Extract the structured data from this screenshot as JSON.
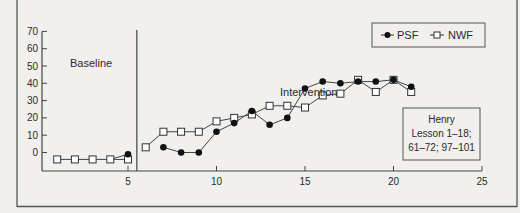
{
  "chart_data": {
    "type": "line",
    "title": "",
    "xlabel": "",
    "ylabel": "",
    "xlim": [
      0,
      25
    ],
    "ylim": [
      -10,
      70
    ],
    "x_ticks": [
      5,
      10,
      15,
      20,
      25
    ],
    "y_ticks": [
      0,
      10,
      20,
      30,
      40,
      50,
      60,
      70
    ],
    "grid": false,
    "legend_position": "upper right (boxed)",
    "phases": [
      {
        "label": "Baseline",
        "sessions": [
          1,
          5
        ]
      },
      {
        "label": "Intervention",
        "sessions": [
          6,
          21
        ]
      }
    ],
    "phase_change_after_session": 5.5,
    "series": [
      {
        "name": "PSF",
        "marker": "filled-circle",
        "segments": [
          {
            "x": [
              5
            ],
            "y": [
              -1
            ]
          },
          {
            "x": [
              7,
              8,
              9,
              10,
              11,
              12,
              13,
              14,
              15,
              16,
              17,
              18,
              19,
              20,
              21
            ],
            "y": [
              3,
              0,
              0,
              12,
              17,
              24,
              16,
              20,
              37,
              41,
              40,
              41,
              41,
              42,
              38
            ]
          }
        ]
      },
      {
        "name": "NWF",
        "marker": "open-square",
        "segments": [
          {
            "x": [
              1,
              2,
              3,
              4,
              5
            ],
            "y": [
              -4,
              -4,
              -4,
              -4,
              -4
            ]
          },
          {
            "x": [
              6,
              7,
              8,
              9,
              10,
              11,
              12,
              13,
              14,
              15,
              16,
              17,
              18,
              19,
              20,
              21
            ],
            "y": [
              3,
              12,
              12,
              12,
              18,
              20,
              22,
              27,
              27,
              26,
              33,
              34,
              42,
              35,
              42,
              35
            ]
          }
        ]
      }
    ],
    "annotations": [
      {
        "text": "Baseline"
      },
      {
        "text": "Intervention"
      },
      {
        "text": "Henry\nLesson 1–18;\n61–72; 97–101"
      }
    ]
  },
  "labels": {
    "baseline": "Baseline",
    "intervention": "Intervention",
    "legend_psf": "PSF",
    "legend_nwf": "NWF",
    "note_line1": "Henry",
    "note_line2": "Lesson 1–18;",
    "note_line3": "61–72; 97–101"
  }
}
